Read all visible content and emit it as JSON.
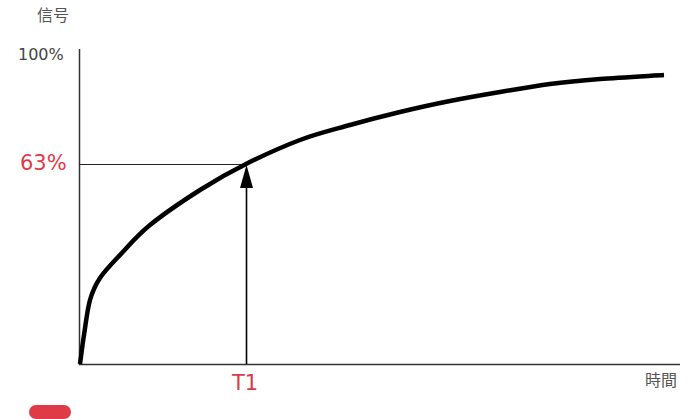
{
  "chart_data": {
    "type": "line",
    "title": "",
    "ylabel": "信号",
    "xlabel": "時間",
    "y_tick_labels": [
      "100%"
    ],
    "annotations": [
      {
        "label": "63%",
        "axis": "y",
        "value": 63,
        "color": "#e03a47"
      },
      {
        "label": "T1",
        "axis": "x",
        "color": "#e03a47",
        "note": "vertical arrow from T1 up to curve at 63%"
      }
    ],
    "ylim": [
      0,
      100
    ],
    "grid": false,
    "series": [
      {
        "name": "signal",
        "description": "saturating recovery curve 1 - e^(-t/T1)",
        "points_px": [
          [
            80,
            364
          ],
          [
            84,
            335
          ],
          [
            90,
            300
          ],
          [
            100,
            278
          ],
          [
            120,
            255
          ],
          [
            150,
            225
          ],
          [
            200,
            190
          ],
          [
            246,
            164
          ],
          [
            300,
            140
          ],
          [
            350,
            125
          ],
          [
            400,
            112
          ],
          [
            450,
            101
          ],
          [
            500,
            92
          ],
          [
            550,
            84
          ],
          [
            600,
            79
          ],
          [
            664,
            75
          ]
        ]
      }
    ]
  },
  "labels": {
    "y_title": "信号",
    "y_max": "100%",
    "y_mark": "63%",
    "x_mark": "T1",
    "x_title": "時間"
  },
  "colors": {
    "accent": "#e03a47",
    "line": "#000000",
    "axis": "#333333"
  }
}
